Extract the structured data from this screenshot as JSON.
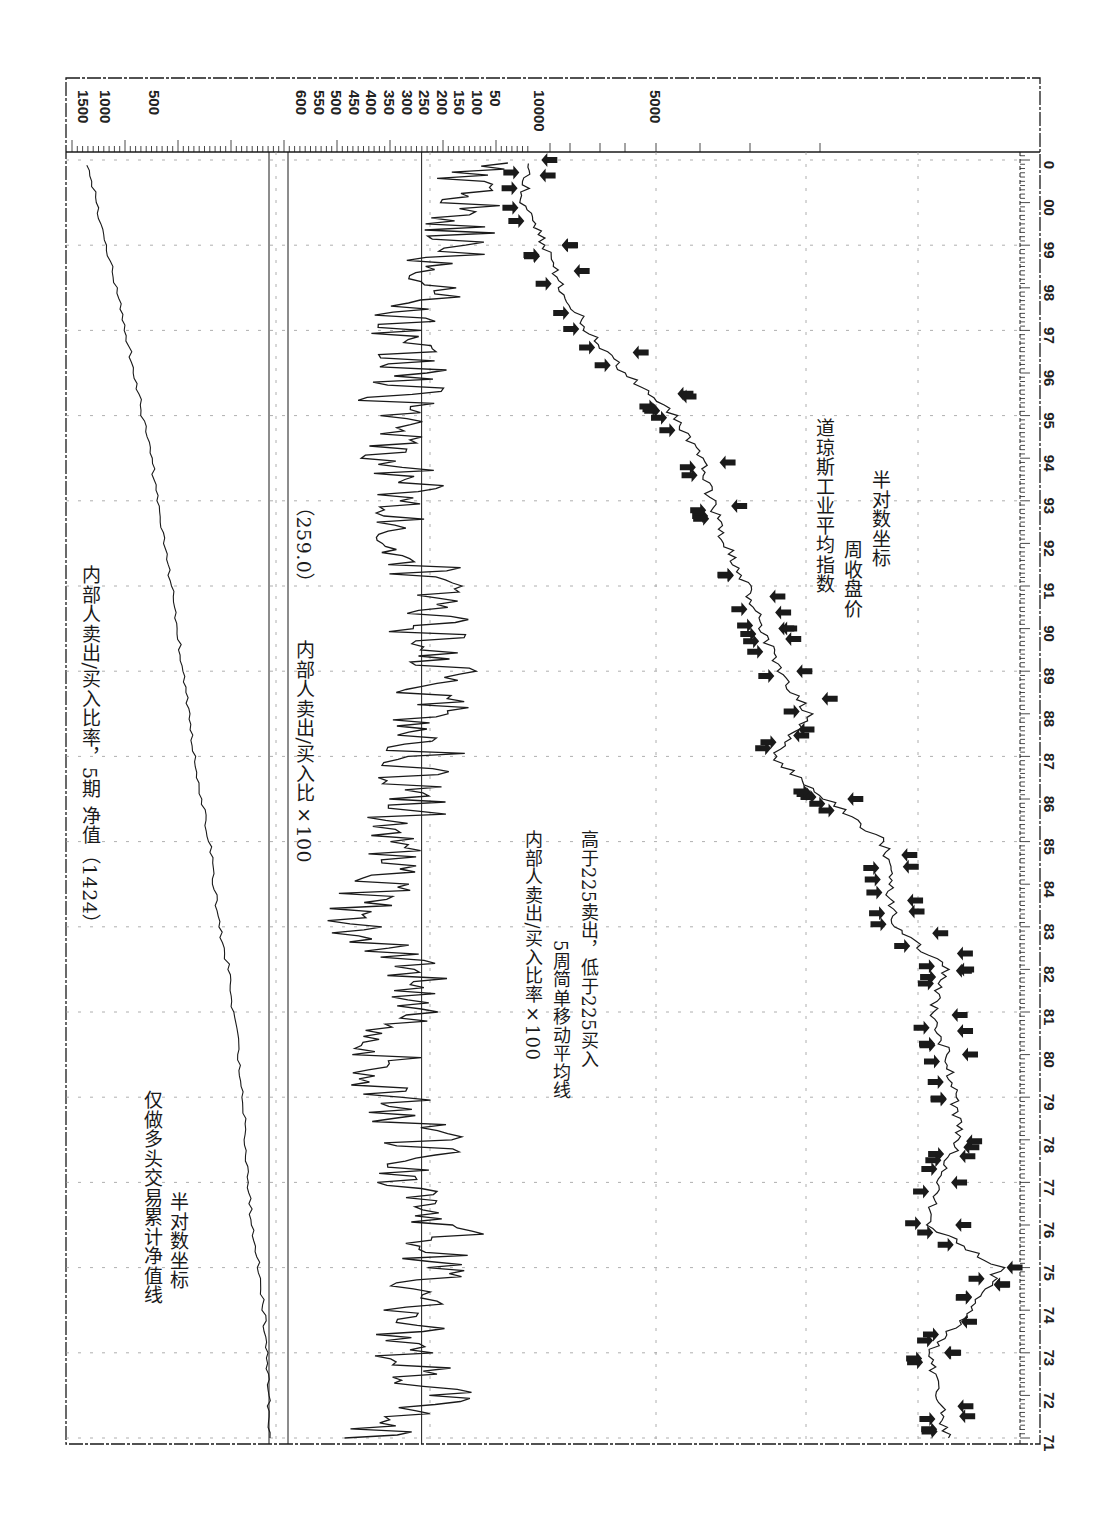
{
  "chart_data": {
    "type": "line",
    "orientation": "rotated-90-clockwise (time axis runs bottom-to-top along right edge)",
    "title": "内部人卖出/买入比率，5期 净值（1424）",
    "x": [
      "71",
      "72",
      "73",
      "74",
      "75",
      "76",
      "77",
      "78",
      "79",
      "80",
      "81",
      "82",
      "83",
      "84",
      "85",
      "86",
      "87",
      "88",
      "89",
      "90",
      "91",
      "92",
      "93",
      "94",
      "95",
      "96",
      "97",
      "98",
      "99",
      "00",
      "0"
    ],
    "xlabel": "年份",
    "panels": [
      {
        "name": "equity",
        "label": "仅做多头交易累计净值线",
        "scale_note": "半对数坐标",
        "axis_ticks": [
          "1500",
          "1000",
          "500"
        ],
        "ylim": [
          100,
          1600
        ],
        "series": [
          {
            "name": "累计净值",
            "values": [
              100,
              102,
              104,
              110,
              118,
              130,
              138,
              142,
              150,
              158,
              170,
              182,
              210,
              225,
              240,
              270,
              300,
              320,
              360,
              380,
              420,
              470,
              520,
              560,
              640,
              720,
              820,
              940,
              1080,
              1250,
              1424
            ]
          }
        ]
      },
      {
        "name": "insider-ratio",
        "label": "内部人卖出/买入比×100",
        "threshold_label": "(259.0)",
        "axis_ticks": [
          "600",
          "550",
          "500",
          "450",
          "400",
          "350",
          "300",
          "250",
          "200",
          "150",
          "100",
          "50"
        ],
        "ylim": [
          0,
          650
        ],
        "reference_line": 259,
        "series": [
          {
            "name": "内部人卖出/买入比率×100 5周简单移动平均",
            "values": [
              380,
              200,
              310,
              270,
              220,
              170,
              260,
              240,
              330,
              350,
              290,
              250,
              410,
              380,
              300,
              280,
              240,
              220,
              200,
              230,
              210,
              300,
              270,
              320,
              340,
              270,
              300,
              210,
              160,
              120,
              110
            ]
          }
        ]
      },
      {
        "name": "djia",
        "label": "道琼斯工业平均指数",
        "sublabel": "周收盘价",
        "scale_note": "半对数坐标",
        "axis_ticks": [
          "10000",
          "5000"
        ],
        "ylim": [
          550,
          12000
        ],
        "series": [
          {
            "name": "道琼斯周收盘价",
            "values": [
              880,
              920,
              980,
              760,
              640,
              980,
              920,
              820,
              840,
              880,
              960,
              880,
              1200,
              1240,
              1280,
              1800,
              2500,
              2000,
              2400,
              2650,
              2900,
              3300,
              3600,
              3800,
              4500,
              6000,
              7500,
              8800,
              9800,
              11000,
              10700
            ]
          }
        ]
      }
    ],
    "annotations": [
      "内部人卖出/买入比率×100",
      "5周简单移动平均线",
      "高于225卖出，低于225买入"
    ],
    "legend_position": "inline text annotations",
    "grid": true
  },
  "text": {
    "main_title": "内部人卖出/买入比率，5期  净值（1424）",
    "equity_label_1": "仅做多头交易累计净值线",
    "equity_label_2": "半对数坐标",
    "ratio_label": "内部人卖出/买入比×100",
    "ratio_value": "（259.0）",
    "ma_label_1": "内部人卖出/买入比率×100",
    "ma_label_2": "5周简单移动平均线",
    "ma_label_3": "高于225卖出，低于225买入",
    "djia_label_1": "道琼斯工业平均指数",
    "djia_label_2": "周收盘价",
    "djia_label_3": "半对数坐标"
  },
  "colors": {
    "ink": "#1a1a1a",
    "grid": "#9a9a9a",
    "background": "#ffffff"
  }
}
